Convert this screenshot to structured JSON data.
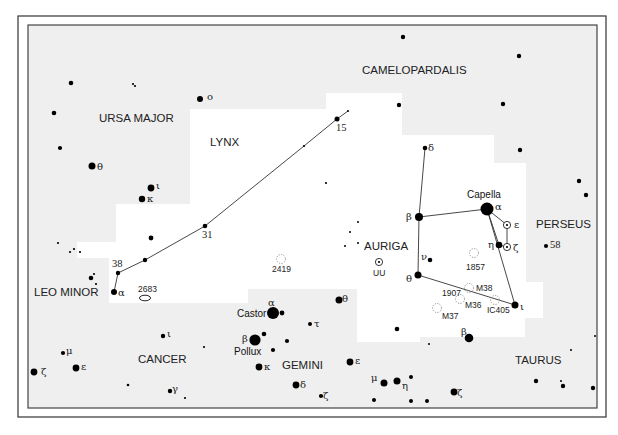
{
  "map": {
    "title": "Auriga and Lynx region star chart",
    "constellations": [
      {
        "name": "CAMELOPARDALIS",
        "x": 362,
        "y": 74
      },
      {
        "name": "URSA MAJOR",
        "x": 99,
        "y": 122
      },
      {
        "name": "LYNX",
        "x": 210,
        "y": 146
      },
      {
        "name": "PERSEUS",
        "x": 536,
        "y": 228
      },
      {
        "name": "AURIGA",
        "x": 364,
        "y": 250
      },
      {
        "name": "LEO MINOR",
        "x": 34,
        "y": 296
      },
      {
        "name": "CANCER",
        "x": 138,
        "y": 363
      },
      {
        "name": "GEMINI",
        "x": 282,
        "y": 369
      },
      {
        "name": "TAURUS",
        "x": 515,
        "y": 364
      }
    ],
    "named_stars": [
      {
        "name": "Capella",
        "x": 467,
        "y": 198
      },
      {
        "name": "Castor",
        "x": 237,
        "y": 317
      },
      {
        "name": "Pollux",
        "x": 234,
        "y": 355
      }
    ],
    "deep_sky": [
      {
        "label": "2419",
        "type": "cluster",
        "x": 281,
        "y": 259,
        "lx": 272,
        "ly": 272
      },
      {
        "label": "2683",
        "type": "galaxy",
        "x": 145,
        "y": 298,
        "lx": 138,
        "ly": 292
      },
      {
        "label": "1857",
        "type": "cluster",
        "x": 474,
        "y": 253,
        "lx": 466,
        "ly": 270
      },
      {
        "label": "M38",
        "type": "cluster",
        "x": 469,
        "y": 288,
        "lx": 476,
        "ly": 291
      },
      {
        "label": "1907",
        "type": "label",
        "x": 0,
        "y": 0,
        "lx": 442,
        "ly": 296
      },
      {
        "label": "M36",
        "type": "cluster",
        "x": 460,
        "y": 299,
        "lx": 465,
        "ly": 308
      },
      {
        "label": "IC405",
        "type": "cluster",
        "x": 495,
        "y": 300,
        "lx": 487,
        "ly": 313
      },
      {
        "label": "M37",
        "type": "cluster",
        "x": 437,
        "y": 308,
        "lx": 442,
        "ly": 319
      }
    ],
    "variables": [
      {
        "label": "UU",
        "x": 379,
        "y": 262,
        "lx": 373,
        "ly": 276
      },
      {
        "label": "ε",
        "x": 507,
        "y": 225,
        "lx": 514,
        "ly": 228
      },
      {
        "label": "ζ",
        "x": 507,
        "y": 247,
        "lx": 513,
        "ly": 251
      }
    ],
    "star_labels": [
      {
        "text": "ο",
        "x": 207,
        "y": 100
      },
      {
        "text": "θ",
        "x": 97,
        "y": 170
      },
      {
        "text": "ι",
        "x": 156,
        "y": 189
      },
      {
        "text": "κ",
        "x": 147,
        "y": 202
      },
      {
        "text": "15",
        "x": 336,
        "y": 131
      },
      {
        "text": "31",
        "x": 202,
        "y": 238
      },
      {
        "text": "38",
        "x": 112,
        "y": 267
      },
      {
        "text": "α",
        "x": 118,
        "y": 296
      },
      {
        "text": "δ",
        "x": 428,
        "y": 151
      },
      {
        "text": "β",
        "x": 406,
        "y": 220
      },
      {
        "text": "α",
        "x": 495,
        "y": 210
      },
      {
        "text": "η",
        "x": 488,
        "y": 248
      },
      {
        "text": "ν",
        "x": 421,
        "y": 260
      },
      {
        "text": "θ",
        "x": 406,
        "y": 282
      },
      {
        "text": "ι",
        "x": 520,
        "y": 310
      },
      {
        "text": "58",
        "x": 550,
        "y": 248
      },
      {
        "text": "α",
        "x": 268,
        "y": 306
      },
      {
        "text": "β",
        "x": 242,
        "y": 342
      },
      {
        "text": "θ",
        "x": 342,
        "y": 302
      },
      {
        "text": "τ",
        "x": 314,
        "y": 327
      },
      {
        "text": "κ",
        "x": 264,
        "y": 370
      },
      {
        "text": "δ",
        "x": 300,
        "y": 388
      },
      {
        "text": "ζ",
        "x": 323,
        "y": 399
      },
      {
        "text": "ε",
        "x": 355,
        "y": 364
      },
      {
        "text": "μ",
        "x": 371,
        "y": 381
      },
      {
        "text": "η",
        "x": 402,
        "y": 389
      },
      {
        "text": "ζ",
        "x": 457,
        "y": 396
      },
      {
        "text": "β",
        "x": 461,
        "y": 335
      },
      {
        "text": "ι",
        "x": 167,
        "y": 337
      },
      {
        "text": "μ",
        "x": 66,
        "y": 354
      },
      {
        "text": "ε",
        "x": 81,
        "y": 370
      },
      {
        "text": "ζ",
        "x": 41,
        "y": 375
      },
      {
        "text": "γ",
        "x": 172,
        "y": 392
      }
    ],
    "stars": [
      {
        "x": 71,
        "y": 83,
        "r": 2.3
      },
      {
        "x": 133,
        "y": 84,
        "r": 1.1
      },
      {
        "x": 135,
        "y": 86,
        "r": 1.1
      },
      {
        "x": 200,
        "y": 99,
        "r": 3
      },
      {
        "x": 403,
        "y": 37,
        "r": 2.2
      },
      {
        "x": 519,
        "y": 56,
        "r": 2.2
      },
      {
        "x": 54,
        "y": 113,
        "r": 2.3
      },
      {
        "x": 399,
        "y": 105,
        "r": 2.2
      },
      {
        "x": 503,
        "y": 104,
        "r": 2.2
      },
      {
        "x": 60,
        "y": 148,
        "r": 2.1
      },
      {
        "x": 92,
        "y": 166,
        "r": 3.5
      },
      {
        "x": 151,
        "y": 188,
        "r": 3.4
      },
      {
        "x": 142,
        "y": 199,
        "r": 3.2
      },
      {
        "x": 520,
        "y": 150,
        "r": 2.2
      },
      {
        "x": 579,
        "y": 181,
        "r": 2.2
      },
      {
        "x": 586,
        "y": 195,
        "r": 2.2
      },
      {
        "x": 337,
        "y": 119,
        "r": 2.5
      },
      {
        "x": 348,
        "y": 111,
        "r": 1
      },
      {
        "x": 304,
        "y": 146,
        "r": 1.1
      },
      {
        "x": 326,
        "y": 183,
        "r": 1.1
      },
      {
        "x": 205,
        "y": 226,
        "r": 2.3
      },
      {
        "x": 151,
        "y": 238,
        "r": 2.4
      },
      {
        "x": 145,
        "y": 260,
        "r": 2.2
      },
      {
        "x": 118,
        "y": 273,
        "r": 2.2
      },
      {
        "x": 114,
        "y": 292,
        "r": 3
      },
      {
        "x": 58,
        "y": 243,
        "r": 1.1
      },
      {
        "x": 70,
        "y": 252,
        "r": 1.1
      },
      {
        "x": 74,
        "y": 249,
        "r": 1.1
      },
      {
        "x": 80,
        "y": 252,
        "r": 1.1
      },
      {
        "x": 91,
        "y": 278,
        "r": 2.3
      },
      {
        "x": 94,
        "y": 274,
        "r": 1.1
      },
      {
        "x": 96,
        "y": 284,
        "r": 1.1
      },
      {
        "x": 425,
        "y": 148,
        "r": 2.3
      },
      {
        "x": 419,
        "y": 217,
        "r": 4
      },
      {
        "x": 487,
        "y": 209,
        "r": 6.5
      },
      {
        "x": 499,
        "y": 245,
        "r": 3.3
      },
      {
        "x": 430,
        "y": 260,
        "r": 2.3
      },
      {
        "x": 418,
        "y": 275,
        "r": 3.5
      },
      {
        "x": 515,
        "y": 305,
        "r": 3.5
      },
      {
        "x": 546,
        "y": 246,
        "r": 2.1
      },
      {
        "x": 358,
        "y": 222,
        "r": 1
      },
      {
        "x": 350,
        "y": 232,
        "r": 1
      },
      {
        "x": 345,
        "y": 246,
        "r": 1
      },
      {
        "x": 358,
        "y": 243,
        "r": 1
      },
      {
        "x": 273,
        "y": 313,
        "r": 6
      },
      {
        "x": 282,
        "y": 313,
        "r": 2.4
      },
      {
        "x": 339,
        "y": 300,
        "r": 3.5
      },
      {
        "x": 310,
        "y": 324,
        "r": 2
      },
      {
        "x": 397,
        "y": 329,
        "r": 2.3
      },
      {
        "x": 429,
        "y": 344,
        "r": 1
      },
      {
        "x": 469,
        "y": 338,
        "r": 4.3
      },
      {
        "x": 255,
        "y": 340,
        "r": 5.6
      },
      {
        "x": 264,
        "y": 334,
        "r": 2.3
      },
      {
        "x": 287,
        "y": 341,
        "r": 2.1
      },
      {
        "x": 273,
        "y": 350,
        "r": 2.1
      },
      {
        "x": 259,
        "y": 367,
        "r": 3.4
      },
      {
        "x": 296,
        "y": 385,
        "r": 3.4
      },
      {
        "x": 321,
        "y": 396,
        "r": 2.1
      },
      {
        "x": 350,
        "y": 362,
        "r": 3.4
      },
      {
        "x": 384,
        "y": 383,
        "r": 3.5
      },
      {
        "x": 397,
        "y": 381,
        "r": 3.5
      },
      {
        "x": 411,
        "y": 377,
        "r": 2
      },
      {
        "x": 374,
        "y": 400,
        "r": 2
      },
      {
        "x": 411,
        "y": 401,
        "r": 2
      },
      {
        "x": 427,
        "y": 401,
        "r": 2
      },
      {
        "x": 454,
        "y": 392,
        "r": 3.4
      },
      {
        "x": 536,
        "y": 381,
        "r": 2.2
      },
      {
        "x": 561,
        "y": 381,
        "r": 1
      },
      {
        "x": 563,
        "y": 386,
        "r": 2.2
      },
      {
        "x": 593,
        "y": 388,
        "r": 2.2
      },
      {
        "x": 571,
        "y": 350,
        "r": 1
      },
      {
        "x": 595,
        "y": 336,
        "r": 1
      },
      {
        "x": 163,
        "y": 336,
        "r": 2.2
      },
      {
        "x": 204,
        "y": 347,
        "r": 1.1
      },
      {
        "x": 63,
        "y": 353,
        "r": 2.1
      },
      {
        "x": 76,
        "y": 368,
        "r": 3.4
      },
      {
        "x": 34,
        "y": 372,
        "r": 3.4
      },
      {
        "x": 128,
        "y": 385,
        "r": 1.3
      },
      {
        "x": 170,
        "y": 391,
        "r": 2.2
      },
      {
        "x": 185,
        "y": 398,
        "r": 1.1
      }
    ],
    "lines": [
      {
        "points": "337,119 304,146 205,226 145,260 118,273"
      },
      {
        "points": "118,273 114,292"
      },
      {
        "points": "337,119 348,111"
      },
      {
        "points": "425,148 419,217 418,275"
      },
      {
        "points": "419,217 487,209"
      },
      {
        "points": "487,209 515,305 418,275"
      },
      {
        "points": "487,209 507,225 507,247 499,245 487,209"
      }
    ]
  }
}
